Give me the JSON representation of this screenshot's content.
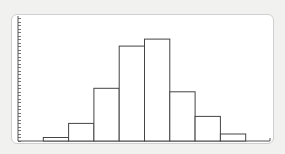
{
  "chart_data": {
    "type": "bar",
    "subtype": "histogram",
    "title": "",
    "xlabel": "",
    "ylabel": "",
    "categories": [
      "bin1",
      "bin2",
      "bin3",
      "bin4",
      "bin5",
      "bin6",
      "bin7",
      "bin8"
    ],
    "values": [
      1,
      5,
      15,
      27,
      29,
      14,
      7,
      2
    ],
    "ylim": [
      0,
      35
    ],
    "y_tick_step": 1,
    "x_bins_total": 9,
    "first_bin_index": 1,
    "grid": false,
    "legend": "none",
    "colors": {
      "bar_fill": "#ffffff",
      "bar_stroke": "#444444",
      "axis": "#555555"
    }
  }
}
